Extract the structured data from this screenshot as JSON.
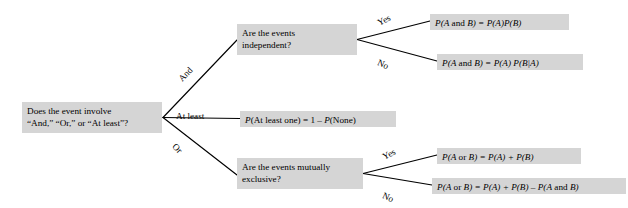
{
  "diagram": {
    "style": {
      "node_fill": "#d5d5d5",
      "line_color": "#000000",
      "background": "#ffffff"
    },
    "nodes": {
      "root": {
        "line1": "Does the event involve",
        "line2": "“And,” “Or,” or  “At least”?"
      },
      "independent": {
        "line1": "Are the events",
        "line2": "independent?"
      },
      "mutually_exclusive": {
        "line1": "Are the events mutually",
        "line2": "exclusive?"
      },
      "at_least_formula": {
        "p1": "P",
        "rest1": "(At least one) = 1 – ",
        "p2": "P",
        "rest2": "(None)"
      },
      "formula_and_independent": {
        "p1": "P",
        "t1": "(A",
        "t2": " and ",
        "t3": "B) = ",
        "p2": "P",
        "t4": "(A)",
        "p3": "P",
        "t5": "(B)"
      },
      "formula_and_dependent": {
        "p1": "P",
        "t1": "(A",
        "t2": " and ",
        "t3": "B) = ",
        "p2": "P",
        "t4": "(A) ",
        "p3": "P",
        "t5": "(B|A)"
      },
      "formula_or_exclusive": {
        "p1": "P",
        "t1": "(A",
        "t2": " or ",
        "t3": "B) = ",
        "p2": "P",
        "t4": "(A) + ",
        "p3": "P",
        "t5": "(B)"
      },
      "formula_or_not_exclusive": {
        "p1": "P",
        "t1": "(A",
        "t2": " or ",
        "t3": "B) = ",
        "p2": "P",
        "t4": "(A) + ",
        "p3": "P",
        "t5": "(B) – ",
        "p4": "P",
        "t6": "(A",
        "t7": " and ",
        "t8": "B)"
      }
    },
    "edge_labels": {
      "and": "And",
      "at_least": "At least",
      "or": "Or",
      "yes_independent": "Yes",
      "no_independent": "No",
      "yes_exclusive": "Yes",
      "no_exclusive": "No"
    }
  }
}
